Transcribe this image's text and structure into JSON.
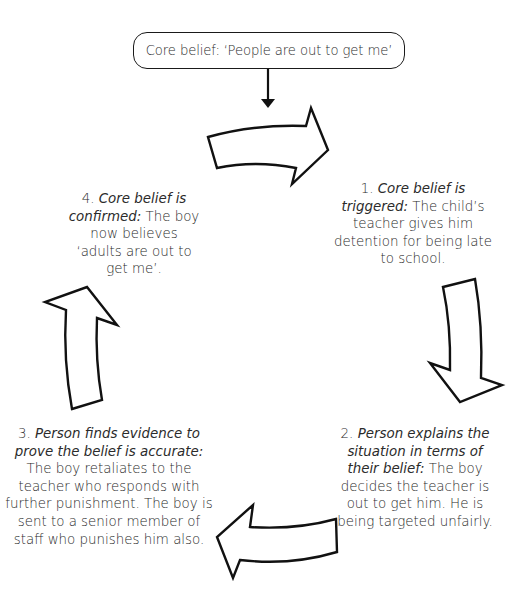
{
  "core_belief": {
    "text": "Core belief: ‘People are out to get me’"
  },
  "steps": [
    {
      "number": "1.",
      "title": "Core belief is triggered:",
      "body": "The child’s teacher gives him detention for being late to school."
    },
    {
      "number": "2.",
      "title": "Person explains the situation in terms of their belief:",
      "body": "The boy decides the teacher is out to get him. He is being targeted unfairly."
    },
    {
      "number": "3.",
      "title": "Person finds evidence to prove the belief is accurate:",
      "body": "The boy retaliates to the teacher who responds with further punishment. The boy is sent to a senior member of staff who punishes him also."
    },
    {
      "number": "4.",
      "title": "Core belief is confirmed:",
      "body": "The boy now believes ‘adults are out to get me’."
    }
  ],
  "arrows": [
    "cycle-arrow-right",
    "cycle-arrow-down",
    "cycle-arrow-left",
    "cycle-arrow-up"
  ],
  "colors": {
    "stroke": "#111111",
    "text": "#2b2b2b",
    "background": "#ffffff"
  }
}
